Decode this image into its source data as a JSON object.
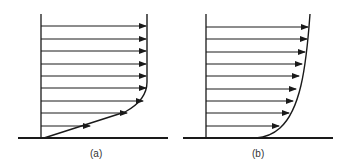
{
  "figure": {
    "panels": [
      {
        "id": "a",
        "caption": "(a)",
        "description": "velocity profile with linear near-wall region",
        "arrow_rows": 9
      },
      {
        "id": "b",
        "caption": "(b)",
        "description": "velocity profile with curved boundary layer",
        "arrow_rows": 9
      }
    ]
  },
  "colors": {
    "line": "#1a1a1a",
    "background": "#ffffff"
  }
}
